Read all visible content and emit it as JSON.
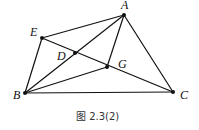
{
  "figure": {
    "caption": "图 2.3(2)",
    "points": {
      "A": {
        "label": "A",
        "x": 124,
        "y": 15
      },
      "E": {
        "label": "E",
        "x": 42,
        "y": 38
      },
      "D": {
        "label": "D",
        "x": 75,
        "y": 53
      },
      "G": {
        "label": "G",
        "x": 107,
        "y": 67
      },
      "B": {
        "label": "B",
        "x": 25,
        "y": 93
      },
      "C": {
        "label": "C",
        "x": 173,
        "y": 92
      }
    },
    "segments": [
      [
        "A",
        "E"
      ],
      [
        "E",
        "B"
      ],
      [
        "B",
        "C"
      ],
      [
        "C",
        "A"
      ],
      [
        "B",
        "A"
      ],
      [
        "E",
        "C"
      ],
      [
        "A",
        "G"
      ],
      [
        "B",
        "G"
      ]
    ],
    "line_color": "#111111"
  }
}
